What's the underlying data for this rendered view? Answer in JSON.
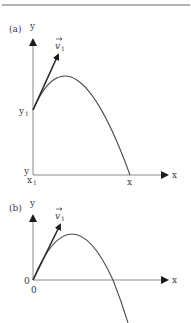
{
  "header_rule": true,
  "diagram_a": {
    "panel_label": "(a)",
    "y_axis_label": "y",
    "x_axis_label": "x",
    "velocity_label": "v",
    "velocity_subscript": "1",
    "initial_height_label": "y",
    "initial_height_subscript": "1",
    "origin_y_label": "y",
    "origin_x_label": "x",
    "origin_x_subscript": "1",
    "landing_x_label": "x"
  },
  "diagram_b": {
    "panel_label": "(b)",
    "y_axis_label": "y",
    "x_axis_label": "x",
    "velocity_label": "v",
    "velocity_subscript": "1",
    "origin_y_label": "0",
    "origin_x_label": "0"
  },
  "colors": {
    "line": "#4a4a4a",
    "axis": "#8a8a8a",
    "text": "#3a3a3a",
    "rule": "#9a9a9a"
  }
}
